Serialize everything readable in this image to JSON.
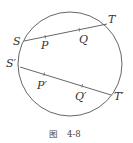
{
  "figure": {
    "caption_prefix": "图",
    "caption_number": "4-8",
    "stroke_color": "#555555",
    "circle": {
      "cx": 70,
      "cy": 64,
      "r": 52
    },
    "chords": [
      {
        "name": "ST",
        "endpoints": {
          "S": [
            24,
            41
          ],
          "T": [
            107,
            24
          ]
        },
        "points": {
          "P": [
            45,
            37
          ],
          "Q": [
            79,
            30
          ]
        },
        "labels": {
          "S": "S",
          "T": "T",
          "P": "P",
          "Q": "Q"
        }
      },
      {
        "name": "S'T'",
        "endpoints": {
          "S'": [
            20,
            67
          ],
          "T'": [
            111,
            95
          ]
        },
        "points": {
          "P'": [
            44,
            75
          ],
          "Q'": [
            82,
            86
          ]
        },
        "labels": {
          "S": "S′",
          "T": "T′",
          "P": "P′",
          "Q": "Q′"
        }
      }
    ]
  }
}
